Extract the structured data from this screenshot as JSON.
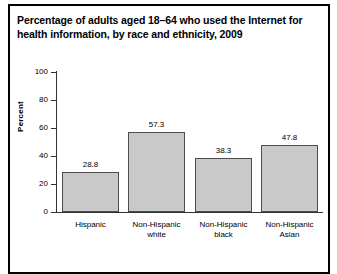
{
  "title": "Percentage of adults aged 18–64 who used the Internet for health information, by race and ethnicity, 2009",
  "chart_data": {
    "type": "bar",
    "title": "Percentage of adults aged 18–64 who used the Internet for health information, by race and ethnicity, 2009",
    "xlabel": "",
    "ylabel": "Percent",
    "ylim": [
      0,
      100
    ],
    "yticks": [
      0,
      20,
      40,
      60,
      80,
      100
    ],
    "grid": false,
    "legend": "none",
    "categories": [
      "Hispanic",
      "Non-Hispanic white",
      "Non-Hispanic black",
      "Non-Hispanic Asian"
    ],
    "category_lines": [
      [
        "Hispanic"
      ],
      [
        "Non-Hispanic",
        "white"
      ],
      [
        "Non-Hispanic",
        "black"
      ],
      [
        "Non-Hispanic",
        "Asian"
      ]
    ],
    "values": [
      28.8,
      57.3,
      38.3,
      47.8
    ],
    "value_labels": [
      "28.8",
      "57.3",
      "38.3",
      "47.8"
    ],
    "bar_fill": "#c9c9c9",
    "bar_edge": "#4d4d4d",
    "axis_color": "#333333",
    "frame_color": "#000000",
    "background": "#ffffff"
  }
}
